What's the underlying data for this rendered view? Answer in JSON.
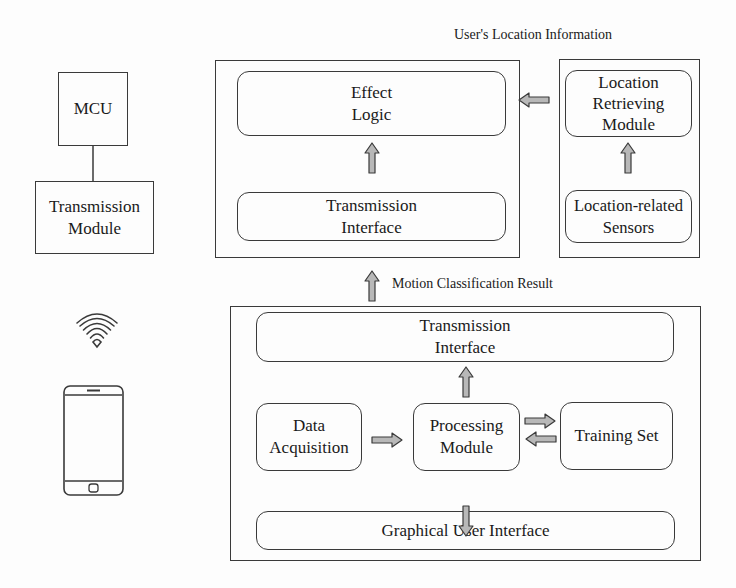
{
  "colors": {
    "stroke": "#3a3a3a",
    "arrow_fill": "#b8b8b8",
    "background": "#fdfdfd"
  },
  "left_device": {
    "mcu_label": "MCU",
    "transmission_module_label": "Transmission\nModule",
    "wireless_icon": "wifi-icon",
    "phone_icon": "smartphone-icon"
  },
  "effect_unit": {
    "effect_logic_label": "Effect\nLogic",
    "transmission_interface_label": "Transmission\nInterface"
  },
  "location_unit": {
    "caption": "User's Location Information",
    "location_retrieving_label": "Location\nRetrieving\nModule",
    "location_sensors_label": "Location-related\nSensors"
  },
  "motion_link": {
    "caption": "Motion Classification Result"
  },
  "phone_unit": {
    "transmission_interface_label": "Transmission\nInterface",
    "data_acquisition_label": "Data\nAcquisition",
    "processing_module_label": "Processing\nModule",
    "training_set_label": "Training Set",
    "gui_label": "Graphical User Interface"
  }
}
